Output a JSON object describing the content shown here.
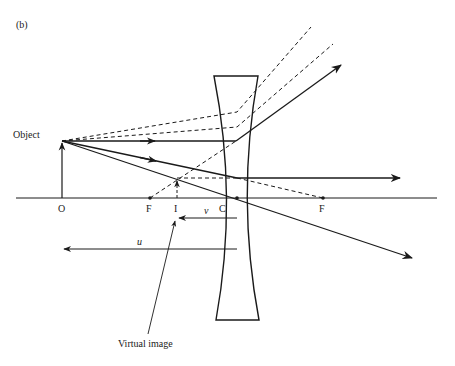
{
  "figure": {
    "panel_label": "(b)"
  },
  "labels": {
    "object": "Object",
    "virtual_image": "Virtual image",
    "origin": "O",
    "focus_left": "F",
    "image_point": "I",
    "center": "C",
    "focus_right": "F",
    "image_distance": "v",
    "object_distance": "u"
  },
  "colors": {
    "ink": "#1a1a1a",
    "background": "#ffffff"
  }
}
